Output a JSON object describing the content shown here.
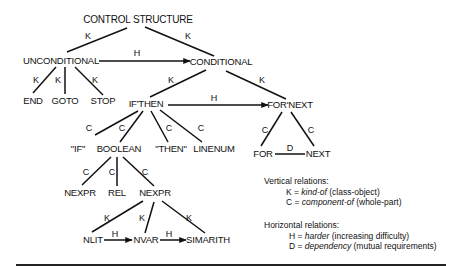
{
  "nodes": {
    "control_structure": "CONTROL STRUCTURE",
    "unconditional": "UNCONDITIONAL",
    "conditional": "CONDITIONAL",
    "end": "END",
    "goto": "GOTO",
    "stop": "STOP",
    "if_then": "IF'THEN",
    "for_next": "FOR'NEXT",
    "if_kw": "\"IF\"",
    "boolean": "BOOLEAN",
    "then_kw": "\"THEN\"",
    "linenum": "LINENUM",
    "for": "FOR",
    "next": "NEXT",
    "nexpr_left": "NEXPR",
    "rel": "REL",
    "nexpr_right": "NEXPR",
    "nlit": "NLIT",
    "nvar": "NVAR",
    "simarith": "SIMARITH"
  },
  "edge_labels": {
    "k": "K",
    "c": "C",
    "h": "H",
    "d": "D"
  },
  "edges": [
    {
      "from": "CONTROL STRUCTURE",
      "to": "UNCONDITIONAL",
      "label": "K"
    },
    {
      "from": "CONTROL STRUCTURE",
      "to": "CONDITIONAL",
      "label": "K"
    },
    {
      "from": "UNCONDITIONAL",
      "to": "CONDITIONAL",
      "label": "H",
      "arrow": true
    },
    {
      "from": "UNCONDITIONAL",
      "to": "END",
      "label": "K"
    },
    {
      "from": "UNCONDITIONAL",
      "to": "GOTO",
      "label": "K"
    },
    {
      "from": "UNCONDITIONAL",
      "to": "STOP",
      "label": "K"
    },
    {
      "from": "CONDITIONAL",
      "to": "IF'THEN",
      "label": "K"
    },
    {
      "from": "CONDITIONAL",
      "to": "FOR'NEXT",
      "label": "K"
    },
    {
      "from": "IF'THEN",
      "to": "FOR'NEXT",
      "label": "H",
      "arrow": true
    },
    {
      "from": "IF'THEN",
      "to": "\"IF\"",
      "label": "C"
    },
    {
      "from": "IF'THEN",
      "to": "BOOLEAN",
      "label": "C"
    },
    {
      "from": "IF'THEN",
      "to": "\"THEN\"",
      "label": "C"
    },
    {
      "from": "IF'THEN",
      "to": "LINENUM",
      "label": "C"
    },
    {
      "from": "FOR'NEXT",
      "to": "FOR",
      "label": "C"
    },
    {
      "from": "FOR'NEXT",
      "to": "NEXT",
      "label": "C"
    },
    {
      "from": "FOR",
      "to": "NEXT",
      "label": "D"
    },
    {
      "from": "BOOLEAN",
      "to": "NEXPR",
      "label": "C"
    },
    {
      "from": "BOOLEAN",
      "to": "REL",
      "label": "C"
    },
    {
      "from": "BOOLEAN",
      "to": "NEXPR",
      "label": "C"
    },
    {
      "from": "NEXPR",
      "to": "NLIT",
      "label": "K"
    },
    {
      "from": "NEXPR",
      "to": "NVAR",
      "label": "K"
    },
    {
      "from": "NEXPR",
      "to": "SIMARITH",
      "label": "K"
    },
    {
      "from": "NLIT",
      "to": "NVAR",
      "label": "H",
      "arrow": true
    },
    {
      "from": "NVAR",
      "to": "SIMARITH",
      "label": "H",
      "arrow": true
    }
  ],
  "legend": {
    "vertical_heading": "Vertical relations:",
    "k_key": "K = ",
    "k_term": "kind-of",
    "k_desc": " (class-object)",
    "c_key": "C = ",
    "c_term": "component-of",
    "c_desc": " (whole-part)",
    "horizontal_heading": "Horizontal relations:",
    "h_key": "H = ",
    "h_term": "harder",
    "h_desc": " (increasing difficulty)",
    "d_key": "D = ",
    "d_term": "dependency",
    "d_desc": " (mutual requirements)"
  }
}
